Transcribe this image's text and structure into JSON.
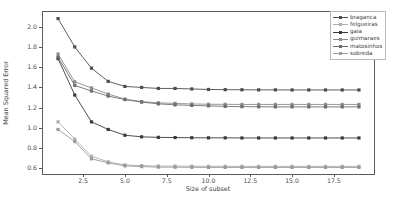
{
  "chart_data": {
    "type": "line",
    "title": "",
    "xlabel": "Size of subset",
    "ylabel": "Mean Squared Error",
    "xlim": [
      0.1,
      19.9
    ],
    "ylim": [
      0.545,
      2.145
    ],
    "xticks": [
      2.5,
      5.0,
      7.5,
      10.0,
      12.5,
      15.0,
      17.5
    ],
    "xticklabels": [
      "2.5",
      "5.0",
      "7.5",
      "10.0",
      "12.5",
      "15.0",
      "17.5"
    ],
    "yticks": [
      0.6,
      0.8,
      1.0,
      1.2,
      1.4,
      1.6,
      1.8,
      2.0
    ],
    "yticklabels": [
      "0.6",
      "0.8",
      "1.0",
      "1.2",
      "1.4",
      "1.6",
      "1.8",
      "2.0"
    ],
    "grid": false,
    "legend_position": "upper right",
    "marker": "square",
    "x": [
      1,
      2,
      3,
      4,
      5,
      6,
      7,
      8,
      9,
      10,
      11,
      12,
      13,
      14,
      15,
      16,
      17,
      18,
      19
    ],
    "series": [
      {
        "name": "braganca",
        "color": "#4d4d4d",
        "values": [
          2.08,
          1.8,
          1.59,
          1.46,
          1.41,
          1.4,
          1.39,
          1.39,
          1.385,
          1.38,
          1.378,
          1.377,
          1.376,
          1.376,
          1.375,
          1.375,
          1.375,
          1.375,
          1.375
        ]
      },
      {
        "name": "felgueiras",
        "color": "#b0b0b0",
        "values": [
          1.06,
          0.89,
          0.72,
          0.665,
          0.635,
          0.628,
          0.624,
          0.623,
          0.622,
          0.621,
          0.621,
          0.62,
          0.62,
          0.62,
          0.62,
          0.62,
          0.62,
          0.62,
          0.62
        ]
      },
      {
        "name": "gaia",
        "color": "#3a3a3a",
        "values": [
          1.685,
          1.325,
          1.06,
          0.985,
          0.928,
          0.912,
          0.907,
          0.905,
          0.903,
          0.902,
          0.902,
          0.901,
          0.901,
          0.901,
          0.901,
          0.901,
          0.901,
          0.901,
          0.901
        ]
      },
      {
        "name": "guimaraes",
        "color": "#8c8c8c",
        "values": [
          1.73,
          1.455,
          1.395,
          1.335,
          1.285,
          1.26,
          1.248,
          1.242,
          1.237,
          1.234,
          1.233,
          1.232,
          1.232,
          1.232,
          1.232,
          1.232,
          1.232,
          1.232,
          1.232
        ]
      },
      {
        "name": "matosinhos",
        "color": "#6e6e6e",
        "values": [
          1.7,
          1.42,
          1.365,
          1.315,
          1.28,
          1.255,
          1.238,
          1.228,
          1.222,
          1.218,
          1.213,
          1.21,
          1.209,
          1.208,
          1.208,
          1.208,
          1.208,
          1.208,
          1.208
        ]
      },
      {
        "name": "sobreda",
        "color": "#9a9a9a",
        "values": [
          0.985,
          0.865,
          0.695,
          0.655,
          0.625,
          0.618,
          0.613,
          0.612,
          0.611,
          0.61,
          0.61,
          0.61,
          0.61,
          0.61,
          0.61,
          0.61,
          0.61,
          0.61,
          0.61
        ]
      }
    ]
  },
  "legend": {
    "entries": [
      "braganca",
      "felgueiras",
      "gaia",
      "guimaraes",
      "matosinhos",
      "sobreda"
    ]
  }
}
